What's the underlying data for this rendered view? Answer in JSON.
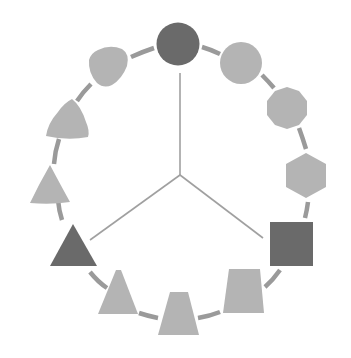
{
  "diagram": {
    "title": "",
    "colors": {
      "background": "#ffffff",
      "highlight": "#6a6a6a",
      "shape": "#b4b4b4",
      "ring": "#9a9a9a",
      "spoke": "#a0a0a0"
    },
    "ring": {
      "cx": 180,
      "cy": 178,
      "r": 135
    },
    "hub": {
      "x": 180,
      "y": 175
    },
    "spokes": [
      {
        "name": "spoke-to-circle",
        "x": 180,
        "y": 73
      },
      {
        "name": "spoke-to-triangle",
        "x": 90,
        "y": 240
      },
      {
        "name": "spoke-to-square",
        "x": 263,
        "y": 238
      }
    ],
    "shapes": [
      {
        "name": "circle-dark",
        "kind": "circle",
        "highlight": true
      },
      {
        "name": "circle-light",
        "kind": "circle",
        "highlight": false
      },
      {
        "name": "decagon",
        "kind": "polygon",
        "highlight": false
      },
      {
        "name": "hexagon",
        "kind": "polygon",
        "highlight": false
      },
      {
        "name": "square-dark",
        "kind": "square",
        "highlight": true
      },
      {
        "name": "trapezoid-wide",
        "kind": "trapezoid",
        "highlight": false
      },
      {
        "name": "trapezoid-mid",
        "kind": "trapezoid",
        "highlight": false
      },
      {
        "name": "trapezoid-narrow",
        "kind": "trapezoid",
        "highlight": false
      },
      {
        "name": "triangle-dark",
        "kind": "triangle",
        "highlight": true
      },
      {
        "name": "curved-triangle-small",
        "kind": "reuleaux",
        "highlight": false
      },
      {
        "name": "curved-triangle-large",
        "kind": "reuleaux",
        "highlight": false
      },
      {
        "name": "rounded-blob",
        "kind": "blob",
        "highlight": false
      }
    ]
  }
}
